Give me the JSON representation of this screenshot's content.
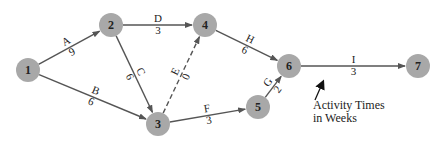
{
  "diagram": {
    "type": "activity-on-arrow network",
    "node_color": "#a8a8a8",
    "edge_color": "#555555",
    "nodes": [
      {
        "id": "1",
        "x": 28,
        "y": 70
      },
      {
        "id": "2",
        "x": 111,
        "y": 25
      },
      {
        "id": "3",
        "x": 158,
        "y": 124
      },
      {
        "id": "4",
        "x": 205,
        "y": 25
      },
      {
        "id": "5",
        "x": 258,
        "y": 107
      },
      {
        "id": "6",
        "x": 289,
        "y": 66
      },
      {
        "id": "7",
        "x": 418,
        "y": 66
      }
    ],
    "activities": [
      {
        "name": "A",
        "from": "1",
        "to": "2",
        "time": "9",
        "dashed": false
      },
      {
        "name": "B",
        "from": "1",
        "to": "3",
        "time": "6",
        "dashed": false
      },
      {
        "name": "C",
        "from": "2",
        "to": "3",
        "time": "6",
        "dashed": false
      },
      {
        "name": "D",
        "from": "2",
        "to": "4",
        "time": "3",
        "dashed": false
      },
      {
        "name": "E",
        "from": "3",
        "to": "4",
        "time": "0",
        "dashed": true
      },
      {
        "name": "F",
        "from": "3",
        "to": "5",
        "time": "3",
        "dashed": false
      },
      {
        "name": "G",
        "from": "5",
        "to": "6",
        "time": "2",
        "dashed": false
      },
      {
        "name": "H",
        "from": "4",
        "to": "6",
        "time": "6",
        "dashed": false
      },
      {
        "name": "I",
        "from": "6",
        "to": "7",
        "time": "3",
        "dashed": false
      }
    ],
    "annotation": {
      "line1": "Activity Times",
      "line2": "in Weeks"
    }
  }
}
